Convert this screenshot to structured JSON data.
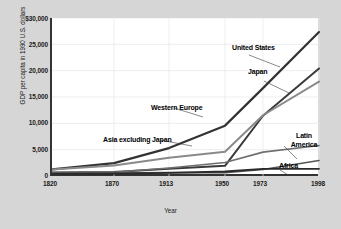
{
  "chart_data": {
    "type": "line",
    "title": "",
    "xlabel": "Year",
    "ylabel": "GDP per capita in 1990 U.S. dollars",
    "x": [
      1820,
      1870,
      1913,
      1950,
      1973,
      1998
    ],
    "xlim": [
      1820,
      1998
    ],
    "ylim": [
      0,
      30000
    ],
    "yticks": [
      0,
      5000,
      10000,
      15000,
      20000,
      25000,
      30000
    ],
    "ytick_labels": [
      "0",
      "5,000",
      "10,000",
      "15,000",
      "20,000",
      "25,000",
      "$30,000"
    ],
    "xtick_labels": [
      "1820",
      "1870",
      "1913",
      "1950",
      "1973",
      "1998"
    ],
    "grid": true,
    "legend_position": "inline-annotations",
    "series": [
      {
        "name": "United States",
        "color": "#333333",
        "values": [
          1257,
          2445,
          5301,
          9561,
          16689,
          27331
        ]
      },
      {
        "name": "Japan",
        "color": "#3a3a3a",
        "values": [
          669,
          737,
          1387,
          1926,
          11439,
          20413
        ]
      },
      {
        "name": "Western Europe",
        "color": "#8a8a8a",
        "values": [
          1232,
          1974,
          3473,
          4594,
          11534,
          17921
        ]
      },
      {
        "name": "Latin America",
        "color": "#6f6f6f",
        "values": [
          665,
          698,
          1511,
          2554,
          4531,
          5795
        ]
      },
      {
        "name": "Asia excluding Japan",
        "color": "#555555",
        "values": [
          575,
          543,
          640,
          635,
          1231,
          2936
        ]
      },
      {
        "name": "Africa",
        "color": "#2a2a2a",
        "values": [
          418,
          444,
          585,
          852,
          1365,
          1368
        ]
      }
    ],
    "annotations": [
      {
        "label": "United States",
        "x_px": 232,
        "y_px": 48
      },
      {
        "label": "Japan",
        "x_px": 248,
        "y_px": 72
      },
      {
        "label": "Western Europe",
        "x_px": 151,
        "y_px": 108
      },
      {
        "label": "Asia excluding Japan",
        "x_px": 103,
        "y_px": 140
      },
      {
        "label": "Latin America",
        "x_px": 284,
        "y_px": 138
      },
      {
        "label": "Africa",
        "x_px": 279,
        "y_px": 166
      }
    ]
  }
}
